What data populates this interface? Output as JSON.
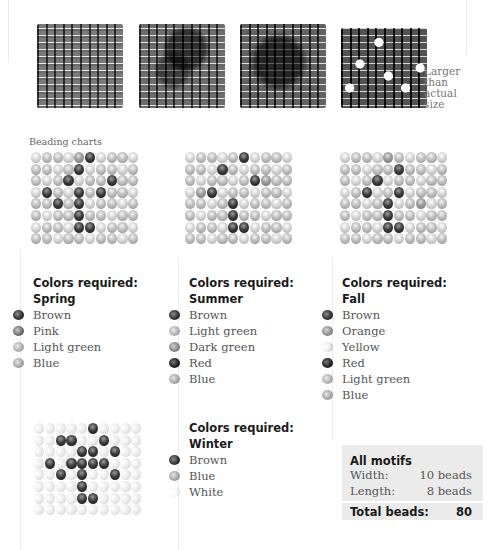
{
  "photos": {
    "caption": "Larger than actual size",
    "items": [
      {
        "name": "Spring swatch"
      },
      {
        "name": "Summer swatch"
      },
      {
        "name": "Fall swatch"
      },
      {
        "name": "Winter swatch"
      }
    ]
  },
  "section_label": "Beading charts",
  "grid": {
    "columns": 10,
    "rows": 8
  },
  "charts": [
    {
      "season": "Spring",
      "pattern": [
        "....md....",
        "....d.....",
        "...d...d..",
        ".d..d.d...",
        "..d.d.....",
        "....d.....",
        "....dd....",
        ".........."
      ]
    },
    {
      "season": "Summer",
      "pattern": [
        ".....d....",
        "...d......",
        "......dm..",
        ".md.......",
        "....d.....",
        "....d.....",
        "....dd....",
        ".........."
      ]
    },
    {
      "season": "Fall",
      "pattern": [
        "....m.....",
        ".....d....",
        "...d......",
        "..d..d....",
        "....d..m..",
        "....d.....",
        "....dd....",
        ".........."
      ]
    },
    {
      "season": "Winter",
      "pattern": [
        ".....d....",
        "..dd..d...",
        "....dd.d..",
        ".d.dddd...",
        "..d.d..d..",
        "....d.....",
        "....dd....",
        ".........."
      ]
    }
  ],
  "legends": [
    {
      "title": "Colors required:",
      "season": "Spring",
      "colors": [
        {
          "label": "Brown",
          "key": "brown"
        },
        {
          "label": "Pink",
          "key": "pink"
        },
        {
          "label": "Light green",
          "key": "lightgreen"
        },
        {
          "label": "Blue",
          "key": "blue"
        }
      ]
    },
    {
      "title": "Colors required:",
      "season": "Summer",
      "colors": [
        {
          "label": "Brown",
          "key": "brown"
        },
        {
          "label": "Light green",
          "key": "lightgreen"
        },
        {
          "label": "Dark green",
          "key": "darkgreen"
        },
        {
          "label": "Red",
          "key": "red"
        },
        {
          "label": "Blue",
          "key": "blue"
        }
      ]
    },
    {
      "title": "Colors required:",
      "season": "Fall",
      "colors": [
        {
          "label": "Brown",
          "key": "brown"
        },
        {
          "label": "Orange",
          "key": "orange"
        },
        {
          "label": "Yellow",
          "key": "yellow"
        },
        {
          "label": "Red",
          "key": "red"
        },
        {
          "label": "Light green",
          "key": "lightgreen"
        },
        {
          "label": "Blue",
          "key": "blue"
        }
      ]
    },
    {
      "title": "Colors required:",
      "season": "Winter",
      "colors": [
        {
          "label": "Brown",
          "key": "brown"
        },
        {
          "label": "Blue",
          "key": "blue"
        },
        {
          "label": "White",
          "key": "white"
        }
      ]
    }
  ],
  "summary": {
    "heading": "All motifs",
    "width_label": "Width:",
    "width_value": "10 beads",
    "length_label": "Length:",
    "length_value": "8 beads",
    "total_label": "Total beads:",
    "total_value": "80"
  }
}
